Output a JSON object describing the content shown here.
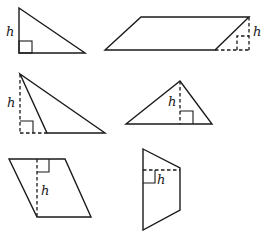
{
  "figure": {
    "stroke_color": "#1a1a1a",
    "background_color": "#ffffff",
    "shapes": [
      {
        "type": "right-triangle",
        "height_label": "h",
        "height_style": "solid-side"
      },
      {
        "type": "parallelogram",
        "height_label": "h",
        "height_style": "dashed-outside"
      },
      {
        "type": "obtuse-triangle",
        "height_label": "h",
        "height_style": "dashed-outside"
      },
      {
        "type": "triangle",
        "height_label": "h",
        "height_style": "dashed-inside"
      },
      {
        "type": "parallelogram",
        "height_label": "h",
        "height_style": "dashed-inside"
      },
      {
        "type": "trapezoid",
        "height_label": "h",
        "height_style": "dashed-inside"
      }
    ]
  }
}
